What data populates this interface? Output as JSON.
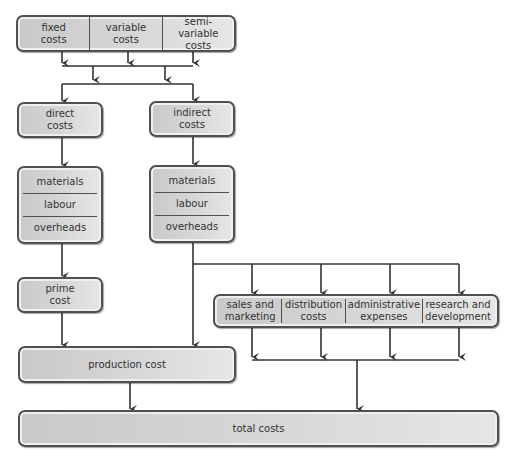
{
  "diagram": {
    "top_box": {
      "cells": [
        "fixed\ncosts",
        "variable\ncosts",
        "semi-variable\ncosts"
      ]
    },
    "direct_costs": "direct\ncosts",
    "indirect_costs": "indirect\ncosts",
    "direct_breakdown": [
      "materials",
      "labour",
      "overheads"
    ],
    "indirect_breakdown": [
      "materials",
      "labour",
      "overheads"
    ],
    "prime_cost": "prime\ncost",
    "overhead_categories": {
      "cells": [
        "sales and\nmarketing",
        "distribution\ncosts",
        "administrative\nexpenses",
        "research and\ndevelopment"
      ]
    },
    "production_cost": "production cost",
    "total_costs": "total costs"
  },
  "colors": {
    "border": "#505050",
    "fill_light": "#e6e6e6",
    "fill_dark": "#c9c9c9",
    "line": "#333333"
  }
}
